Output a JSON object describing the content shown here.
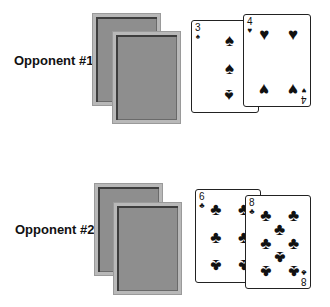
{
  "opponents": [
    {
      "label": "Opponent #1",
      "hidden_cards": 2,
      "face_up_cards": [
        {
          "rank": "3",
          "suit": "spades",
          "suit_glyph": "♠",
          "color": "#111111"
        },
        {
          "rank": "4",
          "suit": "hearts",
          "suit_glyph": "♥",
          "color": "#111111"
        }
      ]
    },
    {
      "label": "Opponent #2",
      "hidden_cards": 2,
      "face_up_cards": [
        {
          "rank": "6",
          "suit": "clubs",
          "suit_glyph": "♣",
          "color": "#111111"
        },
        {
          "rank": "8",
          "suit": "clubs",
          "suit_glyph": "♣",
          "color": "#111111"
        }
      ]
    }
  ],
  "colors": {
    "card_back": "#8e8e8e",
    "card_back_border": "#b8b8b8",
    "card_face": "#ffffff"
  }
}
